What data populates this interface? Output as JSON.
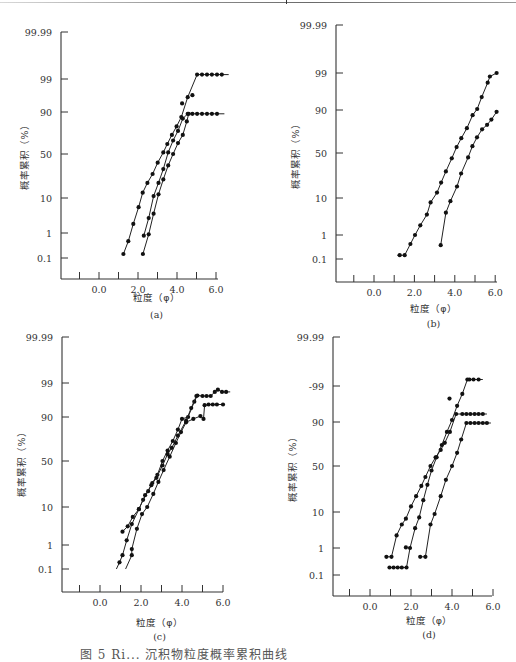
{
  "figure": {
    "caption": "图 5   Ri... 沉积物粒度概率累积曲线"
  },
  "chart_data": [
    {
      "type": "line",
      "panel": "(a)",
      "xlabel": "粒度（φ）",
      "ylabel": "概率累积（%）",
      "x_ticks": [
        -1.0,
        0.0,
        1.0,
        2.0,
        3.0,
        4.0,
        5.0,
        6.0
      ],
      "x_tick_labels": [
        {
          "v": 0.0,
          "t": "0.0"
        },
        {
          "v": 2.0,
          "t": "2.0"
        },
        {
          "v": 4.0,
          "t": "4.0"
        },
        {
          "v": 6.0,
          "t": "6.0"
        }
      ],
      "y_ticks": [
        {
          "v": 99.99,
          "t": "99.99"
        },
        {
          "v": 99,
          "t": "99"
        },
        {
          "v": 90,
          "t": "90"
        },
        {
          "v": 50,
          "t": "50"
        },
        {
          "v": 10,
          "t": "10"
        },
        {
          "v": 1,
          "t": "1"
        },
        {
          "v": 0.1,
          "t": "0.1"
        }
      ],
      "y_scale": "probability",
      "series": [
        {
          "name": "sample-1",
          "points": [
            [
              1.25,
              0.15
            ],
            [
              1.5,
              0.5
            ],
            [
              1.76,
              2
            ],
            [
              2.03,
              6
            ],
            [
              2.24,
              13
            ],
            [
              2.48,
              20
            ],
            [
              2.75,
              28
            ],
            [
              3.01,
              40
            ],
            [
              3.3,
              52
            ],
            [
              3.5,
              62
            ],
            [
              3.74,
              72
            ],
            [
              3.98,
              80
            ],
            [
              4.22,
              87
            ],
            [
              4.55,
              96
            ],
            [
              5.03,
              99.3
            ],
            [
              5.28,
              99.3
            ],
            [
              5.54,
              99.3
            ],
            [
              5.79,
              99.3
            ],
            [
              6.05,
              99.3
            ],
            [
              6.3,
              99.3
            ]
          ],
          "line_end": [
            6.65,
            99.3
          ],
          "extra_points": [
            [
              4.26,
              94
            ],
            [
              4.79,
              96.5
            ]
          ]
        },
        {
          "name": "sample-2",
          "points": [
            [
              2.3,
              0.8
            ],
            [
              2.55,
              3
            ],
            [
              2.8,
              11
            ],
            [
              3.05,
              20
            ],
            [
              3.3,
              33
            ],
            [
              3.55,
              52
            ],
            [
              3.8,
              66
            ],
            [
              4.05,
              76
            ],
            [
              4.3,
              86
            ],
            [
              4.55,
              89
            ],
            [
              4.79,
              89
            ],
            [
              5.03,
              89
            ],
            [
              5.28,
              89
            ],
            [
              5.54,
              89
            ],
            [
              5.79,
              89
            ],
            [
              6.05,
              89
            ]
          ],
          "line_end": [
            6.43,
            89
          ],
          "extra_points": []
        },
        {
          "name": "sample-3",
          "points": [
            [
              2.25,
              0.15
            ],
            [
              2.55,
              0.9
            ],
            [
              2.8,
              4
            ],
            [
              3.05,
              12
            ],
            [
              3.3,
              23
            ],
            [
              3.55,
              37
            ],
            [
              3.8,
              50
            ],
            [
              4.05,
              63
            ],
            [
              4.3,
              72
            ],
            [
              4.5,
              84
            ],
            [
              4.6,
              89
            ]
          ],
          "line_end": null,
          "extra_points": []
        }
      ]
    },
    {
      "type": "line",
      "panel": "(b)",
      "xlabel": "粒度（φ）",
      "ylabel": "概率累积（%）",
      "x_ticks": [
        -1.0,
        0.0,
        1.0,
        2.0,
        3.0,
        4.0,
        5.0,
        6.0
      ],
      "x_tick_labels": [
        {
          "v": 0.0,
          "t": "0.0"
        },
        {
          "v": 2.0,
          "t": "2.0"
        },
        {
          "v": 4.0,
          "t": "4.0"
        },
        {
          "v": 6.0,
          "t": "6.0"
        }
      ],
      "y_ticks": [
        {
          "v": 99.99,
          "t": "99.99"
        },
        {
          "v": 99,
          "t": "99"
        },
        {
          "v": 90,
          "t": "90"
        },
        {
          "v": 50,
          "t": "50"
        },
        {
          "v": 10,
          "t": "10"
        },
        {
          "v": 1,
          "t": "1"
        },
        {
          "v": 0.1,
          "t": "0.1"
        }
      ],
      "y_scale": "probability",
      "series": [
        {
          "name": "sample-1",
          "points": [
            [
              1.27,
              0.15
            ],
            [
              1.52,
              0.15
            ],
            [
              1.8,
              0.45
            ],
            [
              2.03,
              1.0
            ],
            [
              2.29,
              2
            ],
            [
              2.62,
              4
            ],
            [
              2.8,
              8
            ],
            [
              3.12,
              13
            ],
            [
              3.32,
              20
            ],
            [
              3.56,
              30
            ],
            [
              3.85,
              44
            ],
            [
              4.09,
              57
            ],
            [
              4.32,
              67
            ],
            [
              4.6,
              77
            ],
            [
              4.88,
              87
            ],
            [
              5.11,
              90.5
            ],
            [
              5.33,
              95
            ],
            [
              5.63,
              98
            ],
            [
              5.74,
              98.7
            ],
            [
              6.07,
              99
            ]
          ],
          "line_end": [
            1.15,
            0.15
          ],
          "extra_points": []
        },
        {
          "name": "sample-2",
          "points": [
            [
              3.3,
              0.4
            ],
            [
              3.56,
              4.5
            ],
            [
              3.78,
              8.5
            ],
            [
              4.11,
              17
            ],
            [
              4.31,
              28
            ],
            [
              4.66,
              45
            ],
            [
              4.87,
              58
            ],
            [
              5.1,
              68
            ],
            [
              5.35,
              76
            ],
            [
              5.6,
              80
            ],
            [
              5.81,
              84
            ],
            [
              6.07,
              89
            ]
          ],
          "line_end": null,
          "extra_points": []
        }
      ]
    },
    {
      "type": "line",
      "panel": "(c)",
      "xlabel": "粒度（φ）",
      "ylabel": "概率累积（%）",
      "x_ticks": [
        -1.0,
        0.0,
        1.0,
        2.0,
        3.0,
        4.0,
        5.0,
        6.0
      ],
      "x_tick_labels": [
        {
          "v": 0.0,
          "t": "0.0"
        },
        {
          "v": 2.0,
          "t": "2.0"
        },
        {
          "v": 4.0,
          "t": "4.0"
        },
        {
          "v": 6.0,
          "t": "6.0"
        }
      ],
      "y_ticks": [
        {
          "v": 99.99,
          "t": "99.99"
        },
        {
          "v": 99,
          "t": "99"
        },
        {
          "v": 90,
          "t": "90"
        },
        {
          "v": 50,
          "t": "50"
        },
        {
          "v": 10,
          "t": "10"
        },
        {
          "v": 1,
          "t": "1"
        },
        {
          "v": 0.1,
          "t": "0.1"
        }
      ],
      "y_scale": "probability",
      "series": [
        {
          "name": "sample-1",
          "points": [
            [
              1.1,
              2.5
            ],
            [
              1.35,
              3.5
            ],
            [
              1.6,
              6
            ],
            [
              1.9,
              9
            ],
            [
              2.1,
              14
            ],
            [
              2.35,
              20
            ],
            [
              2.55,
              27
            ],
            [
              2.8,
              35
            ],
            [
              3.05,
              50
            ],
            [
              3.3,
              62
            ],
            [
              3.55,
              72
            ],
            [
              3.8,
              82
            ],
            [
              4.0,
              89
            ],
            [
              4.3,
              90
            ],
            [
              4.6,
              96
            ],
            [
              4.75,
              97.4
            ],
            [
              5.0,
              97.3
            ],
            [
              5.2,
              97.3
            ],
            [
              5.4,
              97.3
            ],
            [
              5.6,
              98
            ],
            [
              5.75,
              98.3
            ],
            [
              5.95,
              98
            ],
            [
              6.15,
              98
            ]
          ],
          "line_end": [
            6.35,
            98
          ],
          "extra_points": []
        },
        {
          "name": "sample-2",
          "points": [
            [
              0.95,
              0.2
            ],
            [
              1.1,
              0.4
            ],
            [
              1.3,
              1.4
            ],
            [
              1.55,
              4
            ],
            [
              1.9,
              9
            ],
            [
              2.2,
              17
            ],
            [
              2.5,
              25
            ],
            [
              2.75,
              32
            ],
            [
              3.05,
              45
            ],
            [
              3.3,
              58
            ],
            [
              3.5,
              65
            ],
            [
              3.8,
              77
            ],
            [
              4.2,
              88
            ],
            [
              4.45,
              94
            ],
            [
              4.7,
              97.3
            ]
          ],
          "line_end": [
            0.8,
            0.1
          ],
          "extra_points": []
        },
        {
          "name": "sample-3",
          "points": [
            [
              1.55,
              0.4
            ],
            [
              1.55,
              0.7
            ],
            [
              1.8,
              3
            ],
            [
              2.05,
              7
            ],
            [
              2.3,
              10
            ],
            [
              2.6,
              18
            ],
            [
              2.85,
              28
            ],
            [
              3.1,
              40
            ],
            [
              3.4,
              55
            ],
            [
              3.7,
              70
            ],
            [
              3.95,
              80
            ],
            [
              4.2,
              87
            ],
            [
              4.55,
              89
            ],
            [
              4.9,
              90.5
            ],
            [
              5.05,
              89
            ],
            [
              5.1,
              95
            ],
            [
              5.3,
              95.2
            ],
            [
              5.5,
              95.2
            ],
            [
              5.7,
              95.2
            ],
            [
              6.0,
              95.2
            ]
          ],
          "line_end": [
            1.25,
            0.1
          ],
          "extra_points": []
        }
      ]
    },
    {
      "type": "line",
      "panel": "(d)",
      "xlabel": "粒度（φ）",
      "ylabel": "概率累积（%）",
      "x_ticks": [
        -1.0,
        0.0,
        1.0,
        2.0,
        3.0,
        4.0,
        5.0,
        6.0
      ],
      "x_tick_labels": [
        {
          "v": 0.0,
          "t": "0.0"
        },
        {
          "v": 2.0,
          "t": "2.0"
        },
        {
          "v": 4.0,
          "t": "4.0"
        },
        {
          "v": 6.0,
          "t": "6.0"
        }
      ],
      "y_ticks": [
        {
          "v": 99.99,
          "t": "99.99"
        },
        {
          "v": 99,
          "t": "-99"
        },
        {
          "v": 90,
          "t": "90"
        },
        {
          "v": 50,
          "t": "50"
        },
        {
          "v": 10,
          "t": "10"
        },
        {
          "v": 1,
          "t": "1"
        },
        {
          "v": 0.1,
          "t": "0.1"
        }
      ],
      "y_scale": "probability",
      "series": [
        {
          "name": "sample-1",
          "points": [
            [
              0.8,
              0.5
            ],
            [
              1.05,
              0.5
            ],
            [
              1.3,
              2.5
            ],
            [
              1.55,
              5
            ],
            [
              1.75,
              7
            ],
            [
              2.0,
              13
            ],
            [
              2.25,
              20
            ],
            [
              2.5,
              29
            ],
            [
              2.7,
              38
            ],
            [
              2.95,
              50
            ],
            [
              3.2,
              60
            ],
            [
              3.45,
              68
            ],
            [
              3.65,
              75
            ],
            [
              3.9,
              84
            ],
            [
              4.2,
              93.5
            ],
            [
              4.5,
              93.5
            ],
            [
              4.7,
              93.5
            ],
            [
              4.9,
              93.5
            ],
            [
              5.1,
              93.5
            ],
            [
              5.3,
              93.5
            ],
            [
              5.5,
              93.5
            ]
          ],
          "line_end": [
            5.7,
            93.5
          ],
          "extra_points": []
        },
        {
          "name": "sample-2",
          "points": [
            [
              0.95,
              0.2
            ],
            [
              1.15,
              0.2
            ],
            [
              1.35,
              0.2
            ],
            [
              1.55,
              0.2
            ],
            [
              1.78,
              0.2
            ],
            [
              1.95,
              1.0
            ],
            [
              2.2,
              4
            ],
            [
              2.4,
              7.5
            ],
            [
              2.6,
              17
            ],
            [
              2.8,
              30
            ],
            [
              3.0,
              45
            ],
            [
              3.25,
              60
            ],
            [
              3.5,
              73
            ],
            [
              3.75,
              84
            ],
            [
              4.0,
              91
            ],
            [
              4.25,
              96
            ],
            [
              4.5,
              98.2
            ],
            [
              4.75,
              99.4
            ],
            [
              4.85,
              99.4
            ],
            [
              5.05,
              99.4
            ],
            [
              5.3,
              99.4
            ]
          ],
          "line_end": [
            5.5,
            99.4
          ],
          "extra_points": [
            [
              1.75,
              1.05
            ],
            [
              3.88,
              97.5
            ]
          ]
        },
        {
          "name": "sample-3",
          "points": [
            [
              2.45,
              0.5
            ],
            [
              2.7,
              0.5
            ],
            [
              2.95,
              5
            ],
            [
              3.15,
              9
            ],
            [
              3.45,
              20
            ],
            [
              3.7,
              35
            ],
            [
              4.0,
              50
            ],
            [
              4.25,
              65
            ],
            [
              4.45,
              78
            ],
            [
              4.7,
              89.5
            ],
            [
              4.9,
              89.5
            ],
            [
              5.1,
              89.5
            ],
            [
              5.3,
              89.5
            ],
            [
              5.5,
              89.5
            ],
            [
              5.7,
              89.5
            ]
          ],
          "line_end": [
            5.9,
            89.5
          ],
          "extra_points": []
        }
      ]
    }
  ]
}
